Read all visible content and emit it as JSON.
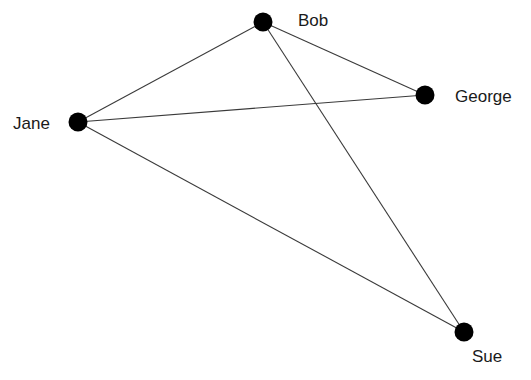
{
  "diagram": {
    "type": "undirected-graph",
    "nodes": [
      {
        "id": "bob",
        "label": "Bob",
        "x": 263,
        "y": 22,
        "label_x": 298,
        "label_y": 26
      },
      {
        "id": "jane",
        "label": "Jane",
        "x": 78,
        "y": 122,
        "label_x": 13,
        "label_y": 129
      },
      {
        "id": "george",
        "label": "George",
        "x": 425,
        "y": 95,
        "label_x": 455,
        "label_y": 102
      },
      {
        "id": "sue",
        "label": "Sue",
        "x": 464,
        "y": 332,
        "label_x": 472,
        "label_y": 362
      }
    ],
    "edges": [
      {
        "from": "bob",
        "to": "jane"
      },
      {
        "from": "bob",
        "to": "george"
      },
      {
        "from": "bob",
        "to": "sue"
      },
      {
        "from": "jane",
        "to": "george"
      },
      {
        "from": "jane",
        "to": "sue"
      }
    ],
    "colors": {
      "node": "#000000",
      "edge": "#3a3a3a",
      "label": "#1a1a1a"
    }
  }
}
